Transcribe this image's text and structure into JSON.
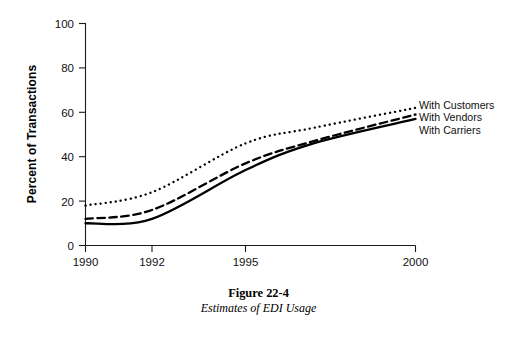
{
  "figure": {
    "caption_title": "Figure 22-4",
    "caption_subtitle": "Estimates of EDI Usage"
  },
  "chart_data": {
    "type": "line",
    "title": "Estimates of EDI Usage",
    "xlabel": "",
    "ylabel": "Percent of Transactions",
    "xlim": [
      1990,
      2000
    ],
    "ylim": [
      0,
      100
    ],
    "grid": false,
    "legend_position": "right-inline-end-of-line",
    "x_tick_labels": [
      "1990",
      "1992",
      "1995",
      "2000"
    ],
    "x_tick_values": [
      1990,
      1992,
      1995,
      2000
    ],
    "y_tick_labels": [
      "0",
      "20",
      "40",
      "60",
      "80",
      "100"
    ],
    "y_tick_values": [
      0,
      20,
      40,
      60,
      80,
      100
    ],
    "x": [
      1990,
      1992,
      1995,
      1997,
      2000
    ],
    "series": [
      {
        "name": "With Customers",
        "style": "dotted",
        "color": "#000000",
        "values": [
          18,
          24,
          46,
          53,
          62
        ]
      },
      {
        "name": "With Vendors",
        "style": "dashed",
        "color": "#000000",
        "values": [
          12,
          16,
          37,
          47,
          59
        ]
      },
      {
        "name": "With Carriers",
        "style": "solid",
        "color": "#000000",
        "values": [
          10,
          12,
          34,
          46,
          57
        ]
      }
    ]
  }
}
